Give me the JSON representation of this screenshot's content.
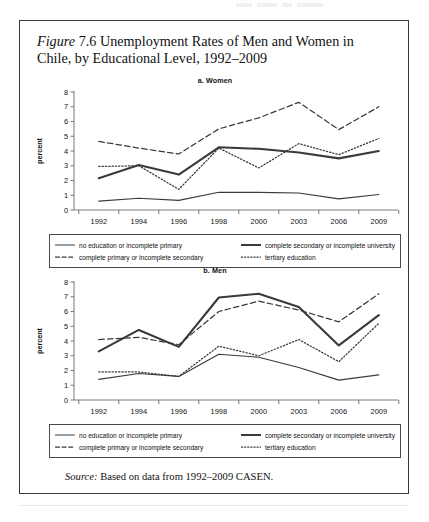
{
  "figure": {
    "number_prefix": "Figure",
    "number": "7.6",
    "title_rest": "Unemployment Rates of Men and Women in Chile, by Educational Level, 1992–2009",
    "source_label": "Source:",
    "source_text": "Based on data from 1992–2009 CASEN."
  },
  "legend": {
    "entries": [
      {
        "label": "no education or incomplete primary",
        "style": "solid-thin"
      },
      {
        "label": "complete secondary or incomplete university",
        "style": "solid-thick"
      },
      {
        "label": "complete primary or incomplete secondary",
        "style": "dashed"
      },
      {
        "label": "tertiary education",
        "style": "dotted"
      }
    ]
  },
  "colors": {
    "ink": "#3a3a3a",
    "axis": "#7a7a7a",
    "text": "#111111",
    "border": "#3a3a3a"
  },
  "chart_data": [
    {
      "type": "line",
      "title": "a. Women",
      "xlabel": "",
      "ylabel": "percent",
      "categories": [
        "1992",
        "1994",
        "1996",
        "1998",
        "2000",
        "2003",
        "2006",
        "2009"
      ],
      "ylim": [
        0,
        8
      ],
      "yticks": [
        0,
        1,
        2,
        3,
        4,
        5,
        6,
        7,
        8
      ],
      "grid": false,
      "legend_position": "below",
      "series": [
        {
          "name": "no education or incomplete primary",
          "style": "solid-thin",
          "values": [
            0.6,
            0.8,
            0.65,
            1.2,
            1.2,
            1.15,
            0.75,
            1.05
          ]
        },
        {
          "name": "complete secondary or incomplete university",
          "style": "solid-thick",
          "values": [
            2.15,
            3.05,
            2.4,
            4.25,
            4.15,
            3.9,
            3.5,
            4.0
          ]
        },
        {
          "name": "complete primary or incomplete secondary",
          "style": "dashed",
          "values": [
            4.65,
            4.2,
            3.8,
            5.5,
            6.25,
            7.3,
            5.45,
            7.0
          ]
        },
        {
          "name": "tertiary education",
          "style": "dotted",
          "values": [
            2.95,
            3.0,
            1.4,
            4.2,
            2.85,
            4.5,
            3.75,
            4.85
          ]
        }
      ]
    },
    {
      "type": "line",
      "title": "b. Men",
      "xlabel": "",
      "ylabel": "percent",
      "categories": [
        "1992",
        "1994",
        "1996",
        "1998",
        "2000",
        "2003",
        "2006",
        "2009"
      ],
      "ylim": [
        0,
        8
      ],
      "yticks": [
        0,
        1,
        2,
        3,
        4,
        5,
        6,
        7,
        8
      ],
      "grid": false,
      "legend_position": "below",
      "series": [
        {
          "name": "no education or incomplete primary",
          "style": "solid-thin",
          "values": [
            1.4,
            1.8,
            1.6,
            3.1,
            2.9,
            2.2,
            1.35,
            1.7
          ]
        },
        {
          "name": "complete secondary or incomplete university",
          "style": "solid-thick",
          "values": [
            3.3,
            4.75,
            3.6,
            6.95,
            7.2,
            6.3,
            3.7,
            5.75
          ]
        },
        {
          "name": "complete primary or incomplete secondary",
          "style": "dashed",
          "values": [
            4.1,
            4.25,
            3.75,
            6.0,
            6.7,
            6.1,
            5.3,
            7.2
          ]
        },
        {
          "name": "tertiary education",
          "style": "dotted",
          "values": [
            1.9,
            1.9,
            1.6,
            3.65,
            3.0,
            4.1,
            2.6,
            5.2
          ]
        }
      ]
    }
  ]
}
